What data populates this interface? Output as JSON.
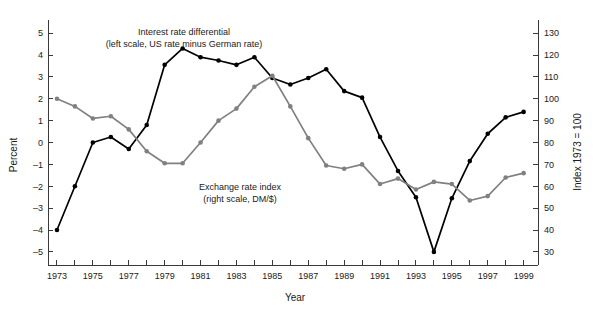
{
  "figure": {
    "width": 595,
    "height": 309,
    "background": "#ffffff"
  },
  "chart_data": {
    "type": "line",
    "title": "",
    "xlabel": "Year",
    "grid": false,
    "legend_position": "inline-annotations",
    "x": [
      1973,
      1974,
      1975,
      1976,
      1977,
      1978,
      1979,
      1980,
      1981,
      1982,
      1983,
      1984,
      1985,
      1986,
      1987,
      1988,
      1989,
      1990,
      1991,
      1992,
      1993,
      1994,
      1995,
      1996,
      1997,
      1998,
      1999
    ],
    "xlim": [
      1972.5,
      1999.8
    ],
    "xticks": [
      1973,
      1974,
      1975,
      1976,
      1977,
      1978,
      1979,
      1980,
      1981,
      1982,
      1983,
      1984,
      1985,
      1986,
      1987,
      1988,
      1989,
      1990,
      1991,
      1992,
      1993,
      1994,
      1995,
      1996,
      1997,
      1998,
      1999
    ],
    "xticklabels": [
      "1973",
      "",
      "1975",
      "",
      "1977",
      "",
      "1979",
      "",
      "1981",
      "",
      "1983",
      "",
      "1985",
      "",
      "1987",
      "",
      "1989",
      "",
      "1991",
      "",
      "1993",
      "",
      "1995",
      "",
      "1997",
      "",
      "1999"
    ],
    "left_axis": {
      "label": "Percent",
      "ylim": [
        -5.6,
        5.6
      ],
      "yticks": [
        -5,
        -4,
        -3,
        -2,
        -1,
        0,
        1,
        2,
        3,
        4,
        5
      ],
      "yticklabels": [
        "–5",
        "–4",
        "–3",
        "–2",
        "–1",
        "0",
        "1",
        "2",
        "3",
        "4",
        "5"
      ]
    },
    "right_axis": {
      "label": "Index 1973 = 100",
      "ylim": [
        24,
        136
      ],
      "yticks": [
        30,
        40,
        50,
        60,
        70,
        80,
        90,
        100,
        110,
        120,
        130
      ],
      "yticklabels": [
        "30",
        "40",
        "50",
        "60",
        "70",
        "80",
        "90",
        "100",
        "110",
        "120",
        "130"
      ]
    },
    "series": [
      {
        "name": "Interest rate differential",
        "annotation_line1": "Interest rate differential",
        "annotation_line2": "(left scale, US rate minus German rate)",
        "axis": "left",
        "color": "#000000",
        "marker": "circle",
        "values": [
          -4.0,
          -2.0,
          0.0,
          0.25,
          -0.3,
          0.8,
          3.55,
          4.3,
          3.9,
          3.75,
          3.55,
          3.9,
          2.95,
          2.65,
          2.95,
          3.35,
          2.35,
          2.05,
          0.25,
          -1.3,
          -2.5,
          -5.0,
          -2.55,
          -0.85,
          0.4,
          1.15,
          1.4
        ]
      },
      {
        "name": "Exchange rate index",
        "annotation_line1": "Exchange rate index",
        "annotation_line2": "(right scale, DM/$)",
        "axis": "right",
        "color": "#808080",
        "marker": "circle",
        "values": [
          100.0,
          96.5,
          91.0,
          92.0,
          86.0,
          76.0,
          70.5,
          70.5,
          80.0,
          90.0,
          95.5,
          105.5,
          110.5,
          96.5,
          82.0,
          69.5,
          68.0,
          70.0,
          61.0,
          63.5,
          58.5,
          62.0,
          61.0,
          53.5,
          55.5,
          64.0,
          66.0
        ]
      }
    ],
    "series2_tail": [
      70.0,
      69.5
    ]
  },
  "annotations": {
    "interest_rate": {
      "line1": "Interest rate differential",
      "line2": "(left scale, US rate minus German rate)"
    },
    "exchange_rate": {
      "line1": "Exchange rate index",
      "line2": "(right scale, DM/$)"
    }
  }
}
